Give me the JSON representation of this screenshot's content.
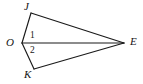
{
  "figure": {
    "type": "geometry-diagram",
    "canvas": {
      "width": 143,
      "height": 84
    },
    "background_color": "#ffffff",
    "line_color": "#1a1a1a",
    "text_color": "#151515",
    "vertices": [
      {
        "id": "J",
        "label": "J",
        "x": 31,
        "y": 13
      },
      {
        "id": "O",
        "label": "O",
        "x": 22,
        "y": 43
      },
      {
        "id": "K",
        "label": "K",
        "x": 34,
        "y": 69
      },
      {
        "id": "E",
        "label": "E",
        "x": 124,
        "y": 43
      }
    ],
    "segments": [
      {
        "id": "OJ",
        "from": "O",
        "to": "J"
      },
      {
        "id": "JE",
        "from": "J",
        "to": "E"
      },
      {
        "id": "OE",
        "from": "O",
        "to": "E"
      },
      {
        "id": "OK",
        "from": "O",
        "to": "K"
      },
      {
        "id": "KE",
        "from": "K",
        "to": "E"
      }
    ],
    "angle_labels": [
      {
        "id": "angle-1",
        "label": "1",
        "at_vertex": "O",
        "between": "JOE",
        "x": 33,
        "y": 36
      },
      {
        "id": "angle-2",
        "label": "2",
        "at_vertex": "O",
        "between": "KOE",
        "x": 33,
        "y": 50
      }
    ]
  }
}
